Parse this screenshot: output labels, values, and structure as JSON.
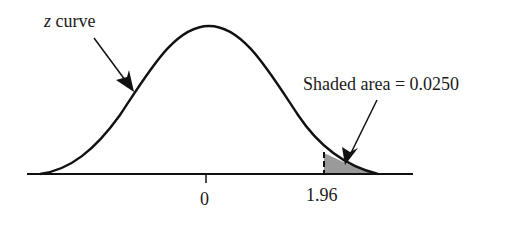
{
  "diagram": {
    "type": "standard normal curve with shaded upper tail",
    "curve_label": {
      "var": "z",
      "text": " curve"
    },
    "area_label": "Shaded area = 0.0250",
    "axis_ticks": [
      {
        "label": "0",
        "value": 0
      },
      {
        "label": "1.96",
        "value": 1.96
      }
    ],
    "shaded_region": {
      "from": 1.96,
      "to": "infinity",
      "area": 0.025
    },
    "colors": {
      "line": "#111111",
      "shade": "#9a9a9a",
      "background": "#ffffff"
    }
  }
}
